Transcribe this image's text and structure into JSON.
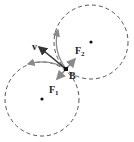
{
  "diagram": {
    "labels": {
      "velocity": "v",
      "force1": "F",
      "force1_sub": "1",
      "force2": "F",
      "force2_sub": "2",
      "point": "B"
    },
    "colors": {
      "circle": "#555555",
      "arc": "#8a8a8a",
      "velocity_arrow": "#333333",
      "force_arrow": "#8a8a8a",
      "text": "#222222"
    }
  }
}
